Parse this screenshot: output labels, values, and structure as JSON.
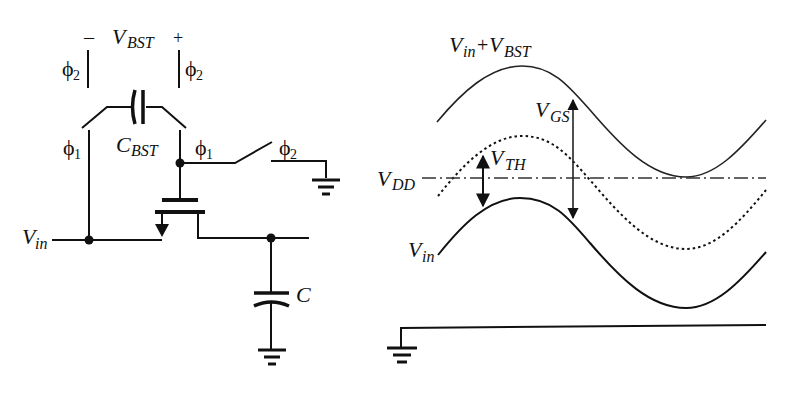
{
  "circuit": {
    "labels": {
      "vbst_minus": "–",
      "vbst_plus": "+",
      "vbst_main": "V",
      "vbst_sub": "BST",
      "cbst_main": "C",
      "cbst_sub": "BST",
      "phi": "ϕ",
      "phi2_left_sub": "2",
      "phi2_right_sub": "2",
      "phi1_left_sub": "1",
      "phi1_right_sub": "1",
      "phi2_switch_sub": "2",
      "vin_main": "V",
      "vin_sub": "in",
      "c_load": "C"
    }
  },
  "waveforms": {
    "labels": {
      "top_main1": "V",
      "top_sub1": "in",
      "top_plus": "+",
      "top_main2": "V",
      "top_sub2": "BST",
      "vgs_main": "V",
      "vgs_sub": "GS",
      "vth_main": "V",
      "vth_sub": "TH",
      "vdd_main": "V",
      "vdd_sub": "DD",
      "vin_main": "V",
      "vin_sub": "in"
    },
    "curves": [
      {
        "name": "Vin+VBST",
        "style": "solid-thin",
        "start": [
          437,
          122
        ],
        "peak": [
          522,
          66
        ],
        "trough": [
          686,
          177
        ],
        "end": [
          766,
          120
        ]
      },
      {
        "name": "Vin+VBST-VTH",
        "style": "dotted",
        "start": [
          438,
          196
        ],
        "peak": [
          522,
          136
        ],
        "trough": [
          686,
          249
        ],
        "end": [
          766,
          190
        ]
      },
      {
        "name": "Vin",
        "style": "solid",
        "start": [
          438,
          255
        ],
        "peak": [
          520,
          198
        ],
        "trough": [
          686,
          308
        ],
        "end": [
          766,
          252
        ]
      }
    ],
    "vdd_level_y": 178,
    "ground_baseline_y": 327
  },
  "colors": {
    "ink": "#111111",
    "background": "#ffffff"
  }
}
